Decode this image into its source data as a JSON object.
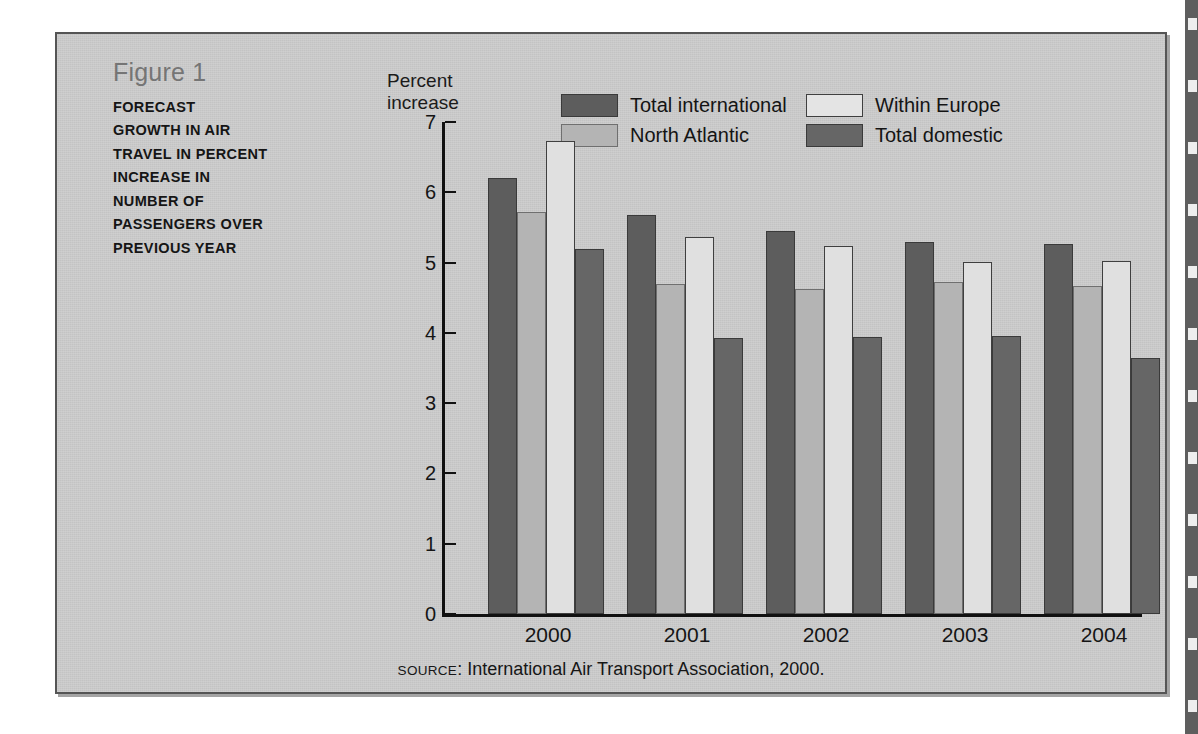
{
  "figure": {
    "number": "Figure 1",
    "title_lines": [
      "FORECAST",
      "GROWTH IN AIR",
      "TRAVEL IN PERCENT",
      "INCREASE IN",
      "NUMBER OF",
      "PASSENGERS OVER",
      "PREVIOUS YEAR"
    ],
    "source_kicker": "SOURCE",
    "source_text": ": International Air Transport Association, 2000.",
    "source_full": "SOURCE: International Air Transport Association, 2000."
  },
  "chart_data": {
    "type": "bar",
    "xlabel": "",
    "ylabel": "Percent increase",
    "ylabel_lines": [
      "Percent",
      "increase"
    ],
    "ylim": [
      0,
      7
    ],
    "yticks": [
      0,
      1,
      2,
      3,
      4,
      5,
      6,
      7
    ],
    "ytick_labels": [
      "0",
      "1",
      "2",
      "3",
      "4",
      "5",
      "6",
      "7"
    ],
    "grid": false,
    "legend_position": "top-right",
    "categories": [
      "2000",
      "2001",
      "2002",
      "2003",
      "2004"
    ],
    "series": [
      {
        "name": "Total international",
        "color": "#5d5d5d",
        "values": [
          6.2,
          5.67,
          5.45,
          5.3,
          5.27
        ]
      },
      {
        "name": "North Atlantic",
        "color": "#b4b4b4",
        "values": [
          5.72,
          4.69,
          4.62,
          4.72,
          4.67
        ]
      },
      {
        "name": "Within Europe",
        "color": "#e0e0e0",
        "values": [
          6.73,
          5.36,
          5.23,
          5.01,
          5.02
        ]
      },
      {
        "name": "Total domestic",
        "color": "#666666",
        "values": [
          5.19,
          3.92,
          3.94,
          3.95,
          3.64
        ]
      }
    ]
  },
  "colors": {
    "panel_background": "#cbcbcb",
    "panel_border": "#555555",
    "axis": "#111111",
    "fig_number": "#757575",
    "text": "#151515",
    "page_edge": "#5e5e5e"
  }
}
